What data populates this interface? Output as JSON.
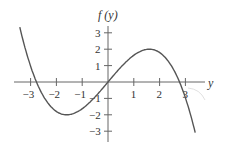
{
  "chart_data": {
    "type": "line",
    "title": "",
    "xlabel": "y",
    "ylabel": "f (y)",
    "xlim": [
      -3.6,
      3.9
    ],
    "ylim": [
      -3.2,
      3.3
    ],
    "x_ticks": [
      -3,
      -2,
      -1,
      1,
      2,
      3
    ],
    "x_tick_labels": [
      "−3",
      "−2",
      "−1",
      "1",
      "2",
      "3"
    ],
    "y_ticks": [
      3,
      2,
      1,
      -1,
      -2,
      -3
    ],
    "y_tick_labels": [
      "3",
      "2",
      "1",
      "−1",
      "−2",
      "−3"
    ],
    "grid": false,
    "legend": null,
    "series": [
      {
        "name": "f(y)",
        "description": "cubic curve with local minimum near (-1.6, -2), passing through origin, local maximum near (1.6, 2), x-intercepts near -2.77, 0, 2.77",
        "x": [
          -3.4,
          -3.0,
          -2.77,
          -2.5,
          -2.0,
          -1.6,
          -1.0,
          -0.5,
          0,
          0.5,
          1.0,
          1.6,
          2.0,
          2.5,
          2.77,
          3.0,
          3.4
        ],
        "y": [
          3.5,
          0.96,
          0.0,
          -0.87,
          -1.8,
          -2.0,
          -1.63,
          -0.91,
          0,
          0.91,
          1.63,
          2.0,
          1.8,
          0.87,
          0.0,
          -0.96,
          -3.2
        ]
      }
    ],
    "annotations": [],
    "colors": {
      "curve": "#555555",
      "axes": "#666666",
      "text": "#333333"
    }
  }
}
